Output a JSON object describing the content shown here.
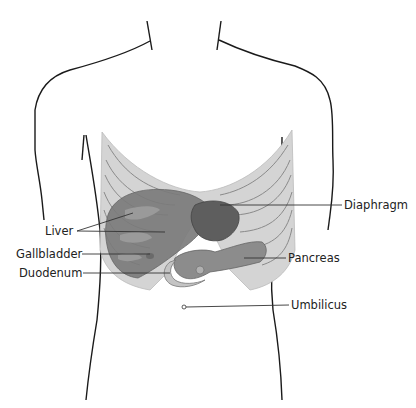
{
  "diagram": {
    "labels": [
      {
        "id": "liver",
        "text": "Liver",
        "side": "left"
      },
      {
        "id": "gallbladder",
        "text": "Gallbladder",
        "side": "left"
      },
      {
        "id": "duodenum",
        "text": "Duodenum",
        "side": "left"
      },
      {
        "id": "diaphragm",
        "text": "Diaphragm",
        "side": "right"
      },
      {
        "id": "pancreas",
        "text": "Pancreas",
        "side": "right"
      },
      {
        "id": "umbilicus",
        "text": "Umbilicus",
        "side": "right"
      }
    ],
    "colors": {
      "outline": "#1a1a1a",
      "ribcage": "#d4d4d4",
      "rib_lines": "#8a8a8a",
      "liver": "#7a7a7a",
      "stomach": "#5e5e5e",
      "pancreas": "#8c8c8c",
      "leader_line": "#333333"
    }
  }
}
